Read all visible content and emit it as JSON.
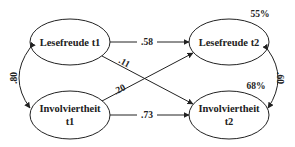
{
  "diagram": {
    "type": "cross-lagged path model",
    "nodes": [
      {
        "id": "lf1",
        "label": "Lesefreude t1"
      },
      {
        "id": "inv1",
        "label_line1": "Involviertheit",
        "label_line2": "t1"
      },
      {
        "id": "lf2",
        "label": "Lesefreude t2",
        "r2": "55%"
      },
      {
        "id": "inv2",
        "label_line1": "Involviertheit",
        "label_line2": "t2",
        "r2": "68%"
      }
    ],
    "paths": [
      {
        "from": "lf1",
        "to": "lf2",
        "value": ".58"
      },
      {
        "from": "lf1",
        "to": "inv2",
        "value": ".11"
      },
      {
        "from": "inv1",
        "to": "lf2",
        "value": ".20"
      },
      {
        "from": "inv1",
        "to": "inv2",
        "value": ".73"
      }
    ],
    "correlations": [
      {
        "between": [
          "lf1",
          "inv1"
        ],
        "value": ".80"
      },
      {
        "between": [
          "lf2",
          "inv2"
        ],
        "value": ".60"
      }
    ]
  }
}
